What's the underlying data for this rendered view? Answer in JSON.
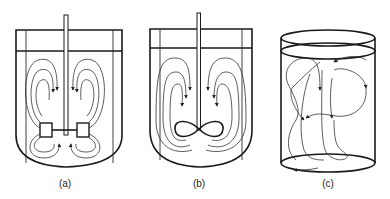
{
  "figure": {
    "panels": [
      {
        "id": "a",
        "label": "(a)",
        "description": "Baffled tank with radial (flat-blade turbine) impeller showing two-loop radial flow pattern"
      },
      {
        "id": "b",
        "label": "(b)",
        "description": "Baffled tank with axial (marine propeller) impeller showing axial flow pattern"
      },
      {
        "id": "c",
        "label": "(c)",
        "description": "Unbaffled cylindrical tank with swirling/random flow pattern"
      }
    ],
    "colors": {
      "line": "#1a1a1a",
      "background": "#ffffff"
    }
  }
}
